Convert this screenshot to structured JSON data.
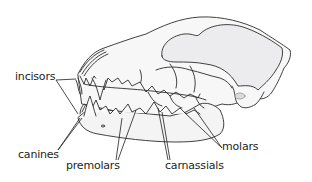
{
  "diagram": {
    "colors": {
      "outline": "#2b2b2b",
      "bone_fill": "#f4f4f5",
      "shadow_fill": "#e6e6e8",
      "label_text": "#231f20",
      "background": "#ffffff"
    },
    "labels": [
      {
        "id": "incisors",
        "text": "incisors"
      },
      {
        "id": "canines",
        "text": "canines"
      },
      {
        "id": "premolars",
        "text": "premolars"
      },
      {
        "id": "carnassials",
        "text": "carnassials"
      },
      {
        "id": "molars",
        "text": "molars"
      }
    ]
  }
}
